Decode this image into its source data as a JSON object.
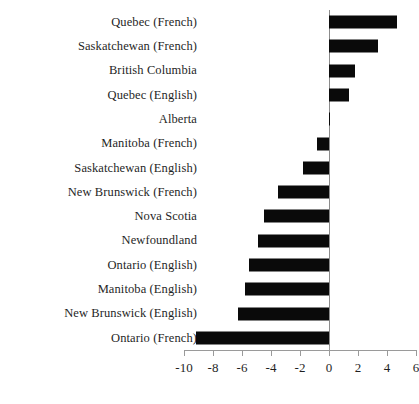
{
  "chart_data": {
    "type": "bar",
    "orientation": "horizontal",
    "title": "",
    "subtitle": "",
    "xlabel": "",
    "ylabel": "",
    "xlim": [
      -10.6,
      6.6
    ],
    "ylim": [],
    "grid": false,
    "legend": null,
    "bar_color": "#0a0a0a",
    "axis_color": "#9a9a9a",
    "zero_reference_line": 0,
    "xticks": [
      -10,
      -8,
      -6,
      -4,
      -2,
      0,
      2,
      4,
      6
    ],
    "xtick_labels": [
      "-10",
      "-8",
      "-6",
      "-4",
      "-2",
      "0",
      "2",
      "4",
      "6"
    ],
    "categories": [
      "Quebec (French)",
      "Saskatchewan (French)",
      "British Columbia",
      "Quebec (English)",
      "Alberta",
      "Manitoba (French)",
      "Saskatchewan (English)",
      "New Brunswick (French)",
      "Nova Scotia",
      "Newfoundland",
      "Ontario (English)",
      "Manitoba (English)",
      "New Brunswick (English)",
      "Ontario (French)"
    ],
    "values": [
      4.7,
      3.4,
      1.8,
      1.4,
      0.05,
      -0.8,
      -1.8,
      -3.5,
      -4.5,
      -4.9,
      -5.5,
      -5.8,
      -6.3,
      -9.2
    ]
  }
}
